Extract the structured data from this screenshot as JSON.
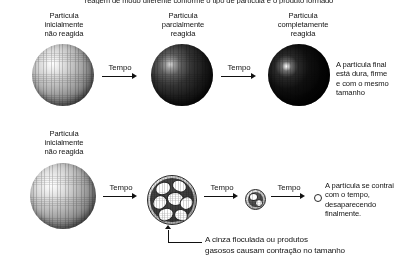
{
  "figure": {
    "top_cut_caption": "reagem de modo diferente conforme o tipo de partícula e o produto formado",
    "rows": [
      {
        "id": "shrinking-core",
        "stages": [
          {
            "id": "unreacted",
            "label": "Partícula\ninicialmente\nnão reagida",
            "icon": "sphere-unreacted"
          },
          {
            "id": "partial",
            "label": "Partícula\nparcialmente\nreagida",
            "icon": "sphere-partially-reacted"
          },
          {
            "id": "complete",
            "label": "Partícula\ncompletamente\nreagida",
            "icon": "sphere-completely-reacted"
          }
        ],
        "arrows": [
          {
            "label": "Tempo"
          },
          {
            "label": "Tempo"
          }
        ],
        "note": "A partícula final\nestá dura, firme\ne com o mesmo\ntamanho"
      },
      {
        "id": "shrinking-particle",
        "stages": [
          {
            "id": "unreacted2",
            "label": "Partícula\ninicialmente\nnão reagida",
            "icon": "sphere-unreacted"
          },
          {
            "id": "ash",
            "label": "",
            "icon": "sphere-ash-flaking"
          },
          {
            "id": "small",
            "label": "",
            "icon": "sphere-small"
          },
          {
            "id": "dot",
            "label": "",
            "icon": "sphere-vanishing-dot"
          }
        ],
        "arrows": [
          {
            "label": "Tempo"
          },
          {
            "label": "Tempo"
          },
          {
            "label": "Tempo"
          }
        ],
        "note": "A partícula se contrai\ncom o tempo,\ndesaparecendo\nfinalmente.",
        "callout": "A cinza floculada ou produtos\ngasosos causam contração no tamanho"
      }
    ],
    "colors": {
      "ink": "#141414",
      "background": "#ffffff",
      "arrow": "#111111"
    }
  }
}
